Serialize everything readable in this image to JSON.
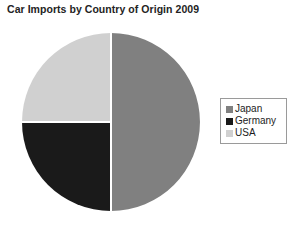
{
  "chart_data": {
    "type": "pie",
    "title": "Car Imports by Country of Origin 2009",
    "xlabel": "",
    "ylabel": "",
    "legend_position": "right",
    "grid": false,
    "categories": [
      "Japan",
      "Germany",
      "USA"
    ],
    "values": [
      50,
      25,
      25
    ],
    "units": "percent",
    "slices": [
      {
        "label": "Japan",
        "value": 50,
        "color": "#808080",
        "start_angle": 0,
        "end_angle": 180
      },
      {
        "label": "Germany",
        "value": 25,
        "color": "#1a1a1a",
        "start_angle": 180,
        "end_angle": 270
      },
      {
        "label": "USA",
        "value": 25,
        "color": "#d0d0d0",
        "start_angle": 270,
        "end_angle": 360
      }
    ]
  },
  "legend": {
    "items": [
      {
        "label": "Japan",
        "color": "#808080"
      },
      {
        "label": "Germany",
        "color": "#1a1a1a"
      },
      {
        "label": "USA",
        "color": "#d0d0d0"
      }
    ]
  },
  "geometry": {
    "center_x": 111,
    "center_y": 122,
    "radius": 89,
    "divider_color": "#ffffff",
    "divider_width": 2
  }
}
